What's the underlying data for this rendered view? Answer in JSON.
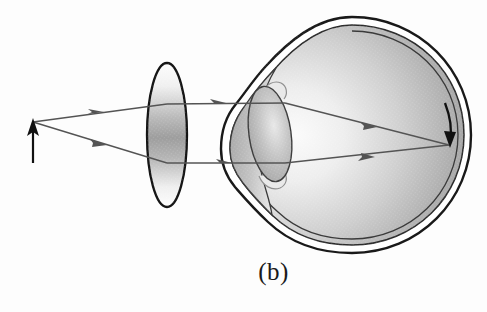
{
  "figure": {
    "caption": "(b)",
    "background_color": "#fdfdfd"
  },
  "colors": {
    "ink": "#111111",
    "ray": "#4f4f4f",
    "sclera_outline": "#1a1a1a",
    "vitreous_light": "#f2f2f2",
    "vitreous_dark": "#8e8e8e",
    "lens_light": "#ffffff",
    "lens_dark": "#9a9a9a",
    "cornea_fill": "#b5b5b5",
    "crystalline_fill": "#b0b0b0"
  },
  "object_arrow": {
    "name": "object-arrow",
    "label": "",
    "tip_x": 33,
    "tip_y": 122,
    "base_x": 33,
    "base_y": 162,
    "color": "#111111",
    "direction": "up"
  },
  "image_arrow": {
    "name": "retinal-image-arrow",
    "label": "",
    "tip_x": 450,
    "tip_y": 146,
    "base_x": 446,
    "base_y": 104,
    "color": "#111111",
    "direction": "down",
    "note": "inverted image formed on retina"
  },
  "corrective_lens": {
    "name": "corrective-lens",
    "label": "",
    "center_x": 167,
    "center_y": 135,
    "rx": 20,
    "ry": 72,
    "type": "converging"
  },
  "crystalline_lens": {
    "name": "crystalline-lens",
    "label": "",
    "center_x": 270,
    "center_y": 134,
    "rx": 21,
    "ry": 48,
    "tilt_deg": -8
  },
  "eyeball": {
    "name": "eyeball",
    "label": "",
    "center_x": 352,
    "center_y": 135,
    "radius": 118,
    "cornea_apex_x": 223,
    "top_y": 18,
    "bottom_y": 252,
    "right_x": 472
  },
  "rays": [
    {
      "name": "upper-ray",
      "label": "",
      "points": [
        [
          33,
          122
        ],
        [
          167,
          104
        ],
        [
          285,
          103
        ],
        [
          449,
          145
        ]
      ],
      "arrowheads": [
        [
          97,
          113
        ],
        [
          218,
          103
        ],
        [
          370,
          125
        ]
      ]
    },
    {
      "name": "lower-ray",
      "label": "",
      "points": [
        [
          33,
          122
        ],
        [
          167,
          163
        ],
        [
          285,
          163
        ],
        [
          449,
          145
        ]
      ],
      "arrowheads": [
        [
          100,
          146
        ],
        [
          225,
          163
        ],
        [
          372,
          158
        ]
      ]
    }
  ],
  "legend": {
    "items": []
  }
}
